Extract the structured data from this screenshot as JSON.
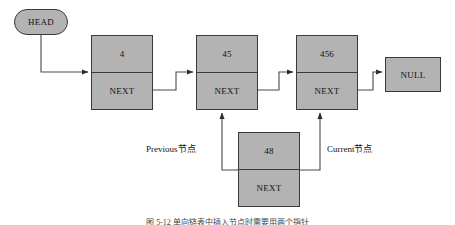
{
  "diagram": {
    "background_color": "#ffffff",
    "node_fill_color": "#b3b3b3",
    "node_border_color": "#3a3a3a",
    "line_color": "#4a4a4a",
    "head": {
      "label": "HEAD"
    },
    "nodes": [
      {
        "data": "4",
        "next_label": "NEXT"
      },
      {
        "data": "45",
        "next_label": "NEXT"
      },
      {
        "data": "456",
        "next_label": "NEXT"
      }
    ],
    "terminator": {
      "label": "NULL"
    },
    "inserted_node": {
      "data": "48",
      "next_label": "NEXT"
    },
    "annotations": {
      "previous": "Previous节点",
      "current": "Current节点"
    },
    "caption": "图 5-12 单向链表中插入节点时需要用两个指针"
  }
}
